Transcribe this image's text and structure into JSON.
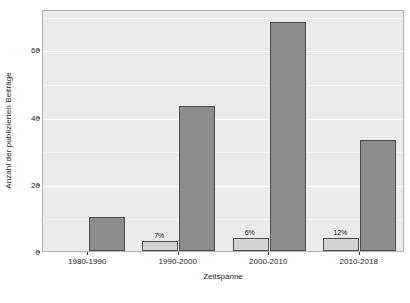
{
  "chart_data": {
    "type": "bar",
    "title": "",
    "xlabel": "Zeitspanne",
    "ylabel": "Anzahl der publizierten Beiträge",
    "categories": [
      "1980-1990",
      "1990-2000",
      "2000-2010",
      "2010-2018"
    ],
    "ylim": [
      0,
      72
    ],
    "yticks": [
      0,
      20,
      40,
      60
    ],
    "ytick_labels": [
      "0",
      "20",
      "40",
      "60"
    ],
    "grid": true,
    "legend": "none",
    "series": [
      {
        "name": "light",
        "color": "#d4d4d4",
        "values": [
          0,
          3,
          4,
          4
        ],
        "labels": [
          "",
          "7%",
          "6%",
          "12%"
        ]
      },
      {
        "name": "dark",
        "color": "#8c8c8c",
        "values": [
          10,
          43,
          68,
          33
        ],
        "labels": [
          "",
          "",
          "",
          ""
        ]
      }
    ]
  },
  "panel": {
    "background": "#ebebeb",
    "gridline_color": "#ffffff",
    "border_color": "#b0b0b0"
  },
  "axis": {
    "tick_color": "#333333",
    "text_color": "#1a1a1a"
  }
}
